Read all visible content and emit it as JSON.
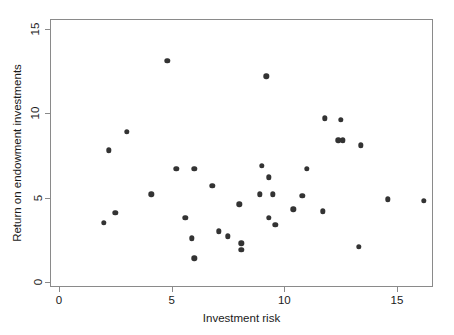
{
  "chart_data": {
    "type": "scatter",
    "title": "",
    "xlabel": "Investment risk",
    "ylabel": "Return on endowment investments",
    "xlim": [
      0,
      17
    ],
    "ylim": [
      0,
      15.6
    ],
    "xticks": [
      0,
      5,
      10,
      15
    ],
    "yticks": [
      0,
      5,
      10,
      15
    ],
    "xtick_labels": [
      "0",
      "5",
      "10",
      "15"
    ],
    "ytick_labels": [
      "0",
      "5",
      "10",
      "15"
    ],
    "grid": false,
    "legend": null,
    "marker": "filled-circle",
    "marker_color": "#333333",
    "frame_color": "#8a8a8a",
    "background": "#ffffff",
    "points": [
      {
        "x": 2.0,
        "y": 3.5
      },
      {
        "x": 2.2,
        "y": 7.8
      },
      {
        "x": 2.5,
        "y": 4.1
      },
      {
        "x": 3.0,
        "y": 8.9
      },
      {
        "x": 4.1,
        "y": 5.2
      },
      {
        "x": 4.8,
        "y": 13.1
      },
      {
        "x": 5.2,
        "y": 6.7
      },
      {
        "x": 5.6,
        "y": 3.8
      },
      {
        "x": 5.9,
        "y": 2.6
      },
      {
        "x": 6.0,
        "y": 6.7
      },
      {
        "x": 6.0,
        "y": 1.4
      },
      {
        "x": 6.8,
        "y": 5.7
      },
      {
        "x": 7.1,
        "y": 3.0
      },
      {
        "x": 7.5,
        "y": 2.7
      },
      {
        "x": 8.0,
        "y": 4.6
      },
      {
        "x": 8.1,
        "y": 2.3
      },
      {
        "x": 8.1,
        "y": 1.9
      },
      {
        "x": 8.9,
        "y": 5.2
      },
      {
        "x": 9.0,
        "y": 6.9
      },
      {
        "x": 9.2,
        "y": 12.2
      },
      {
        "x": 9.3,
        "y": 6.2
      },
      {
        "x": 9.3,
        "y": 3.8
      },
      {
        "x": 9.5,
        "y": 5.2
      },
      {
        "x": 9.6,
        "y": 3.4
      },
      {
        "x": 10.4,
        "y": 4.3
      },
      {
        "x": 10.8,
        "y": 5.1
      },
      {
        "x": 11.0,
        "y": 6.7
      },
      {
        "x": 11.7,
        "y": 4.2
      },
      {
        "x": 11.8,
        "y": 9.7
      },
      {
        "x": 12.4,
        "y": 8.4
      },
      {
        "x": 12.6,
        "y": 8.4
      },
      {
        "x": 12.5,
        "y": 9.6
      },
      {
        "x": 13.4,
        "y": 8.1
      },
      {
        "x": 13.3,
        "y": 2.1
      },
      {
        "x": 14.6,
        "y": 4.9
      },
      {
        "x": 16.2,
        "y": 4.8
      }
    ]
  }
}
